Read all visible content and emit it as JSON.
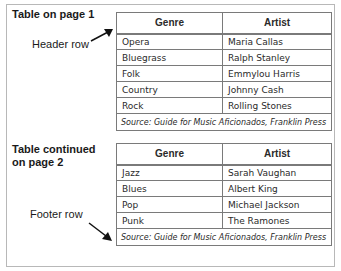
{
  "labels": {
    "table1_title": "Table on page 1",
    "header_row": "Header row",
    "table2_title_line1": "Table continued",
    "table2_title_line2": "on page 2",
    "footer_row": "Footer row"
  },
  "table1": {
    "headers": [
      "Genre",
      "Artist"
    ],
    "rows": [
      [
        "Opera",
        "Maria Callas"
      ],
      [
        "Bluegrass",
        "Ralph Stanley"
      ],
      [
        "Folk",
        "Emmylou Harris"
      ],
      [
        "Country",
        "Johnny Cash"
      ],
      [
        "Rock",
        "Rolling Stones"
      ]
    ],
    "source": "Source: Guide for Music Aficionados, Franklin Press"
  },
  "table2": {
    "headers": [
      "Genre",
      "Artist"
    ],
    "rows": [
      [
        "Jazz",
        "Sarah Vaughan"
      ],
      [
        "Blues",
        "Albert King"
      ],
      [
        "Pop",
        "Michael Jackson"
      ],
      [
        "Punk",
        "The Ramones"
      ]
    ],
    "source": "Source: Guide for Music Aficionados, Franklin Press"
  },
  "colors": {
    "border": "#7a7a7a",
    "frame": "#b8b8b8",
    "text": "#2a2a2a"
  }
}
